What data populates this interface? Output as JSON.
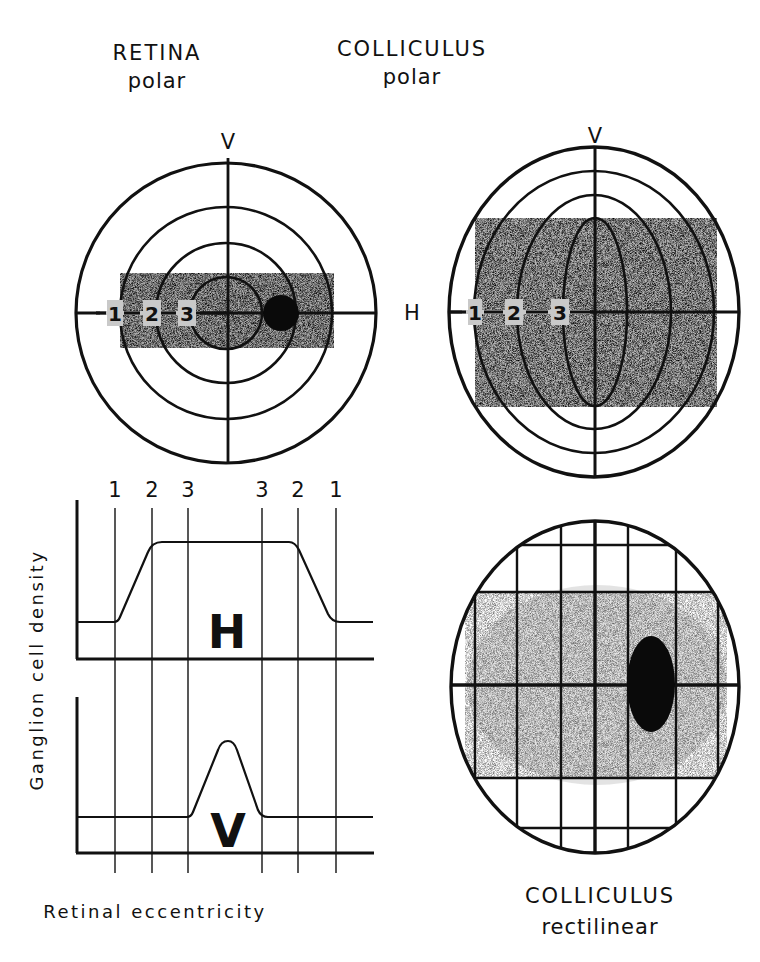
{
  "retina_polar": {
    "title": "RETINA",
    "subtitle": "polar",
    "v_label": "V",
    "eccentricity_labels": [
      "1",
      "2",
      "3"
    ]
  },
  "colliculus_polar": {
    "title": "COLLICULUS",
    "subtitle": "polar",
    "v_label": "V",
    "h_label": "H",
    "eccentricity_labels": [
      "1",
      "2",
      "3"
    ]
  },
  "colliculus_rectilinear": {
    "title": "COLLICULUS",
    "subtitle": "rectilinear"
  },
  "density_graph": {
    "y_label": "Ganglion cell density",
    "x_label": "Retinal eccentricity",
    "tick_labels": [
      "1",
      "2",
      "3",
      "3",
      "2",
      "1"
    ],
    "h_panel_label": "H",
    "v_panel_label": "V"
  },
  "colors": {
    "ink": "#111111",
    "shade": "#b8b8b8",
    "background": "#ffffff"
  }
}
